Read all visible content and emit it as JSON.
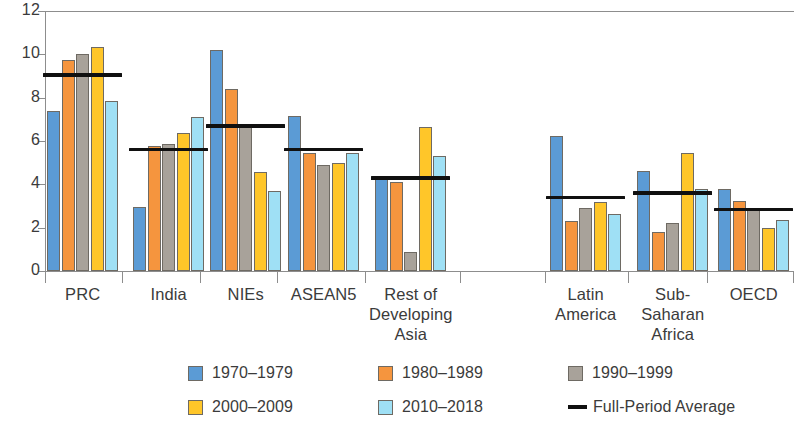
{
  "chart_data": {
    "type": "bar",
    "title": "",
    "xlabel": "",
    "ylabel": "",
    "ylim": [
      0,
      12
    ],
    "ytick_values": [
      0,
      2,
      4,
      6,
      8,
      10,
      12
    ],
    "ytick_labels": [
      "0",
      "2",
      "4",
      "6",
      "8",
      "10",
      "12"
    ],
    "grid": false,
    "legend_position": "bottom",
    "categories": [
      "PRC",
      "India",
      "NIEs",
      "ASEAN5",
      "Rest of Developing Asia",
      "Latin America",
      "Sub-Saharan Africa",
      "OECD"
    ],
    "category_label_lines": [
      [
        "PRC"
      ],
      [
        "India"
      ],
      [
        "NIEs"
      ],
      [
        "ASEAN5"
      ],
      [
        "Rest of",
        "Developing",
        "Asia"
      ],
      [
        "Latin",
        "America"
      ],
      [
        "Sub-",
        "Saharan",
        "Africa"
      ],
      [
        "OECD"
      ]
    ],
    "series": [
      {
        "name": "1970–1979",
        "color": "#5b9bd5",
        "values": [
          7.4,
          2.95,
          10.2,
          7.15,
          4.3,
          6.25,
          4.6,
          3.8
        ]
      },
      {
        "name": "1980–1989",
        "color": "#f5953e",
        "values": [
          9.75,
          5.75,
          8.4,
          5.45,
          4.1,
          2.3,
          1.8,
          3.25
        ]
      },
      {
        "name": "1990–1999",
        "color": "#a8a29a",
        "values": [
          10.0,
          5.85,
          6.7,
          4.9,
          0.9,
          2.9,
          2.2,
          2.85
        ]
      },
      {
        "name": "2000–2009",
        "color": "#ffc629",
        "values": [
          10.35,
          6.35,
          4.55,
          5.0,
          6.65,
          3.2,
          5.45,
          2.0
        ]
      },
      {
        "name": "2010–2018",
        "color": "#9fe0f5",
        "values": [
          7.85,
          7.1,
          3.7,
          5.45,
          5.3,
          2.65,
          3.8,
          2.35
        ]
      }
    ],
    "average_series": {
      "name": "Full-Period Average",
      "color": "#101010",
      "values": [
        9.05,
        5.6,
        6.7,
        5.6,
        4.3,
        3.4,
        3.6,
        2.85
      ]
    }
  },
  "legend": {
    "items": [
      {
        "label": "1970–1979",
        "color": "#5b9bd5",
        "marker": "swatch"
      },
      {
        "label": "1980–1989",
        "color": "#f5953e",
        "marker": "swatch"
      },
      {
        "label": "1990–1999",
        "color": "#a8a29a",
        "marker": "swatch"
      },
      {
        "label": "2000–2009",
        "color": "#ffc629",
        "marker": "swatch"
      },
      {
        "label": "2010–2018",
        "color": "#9fe0f5",
        "marker": "swatch"
      },
      {
        "label": "Full-Period Average",
        "color": "#101010",
        "marker": "line"
      }
    ]
  }
}
